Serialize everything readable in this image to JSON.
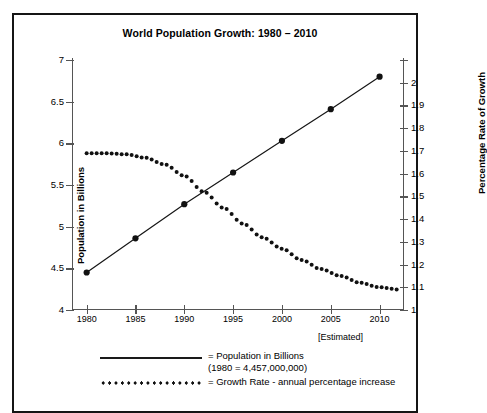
{
  "chart_data": {
    "type": "line",
    "title": "World Population Growth: 1980 – 2010",
    "xlabel": "",
    "x_note": "[Estimated]",
    "categories": [
      1980,
      1985,
      1990,
      1995,
      2000,
      2005,
      2010
    ],
    "xlim": [
      1978.5,
      2012.5
    ],
    "xticks": [
      "1980",
      "1985",
      "1990",
      "1995",
      "2000",
      "2005",
      "2010"
    ],
    "grid": false,
    "legend_position": "below-plot",
    "axes": {
      "left": {
        "label": "Population in Billions",
        "min": 4,
        "max": 7,
        "step": 0.5,
        "ticks": [
          "4",
          "4.5",
          "5",
          "5.5",
          "6",
          "6.5",
          "7"
        ]
      },
      "right": {
        "label": "Percentage Rate of Growth",
        "min": 1,
        "max": 2.1,
        "step": 0.1,
        "ticks": [
          "1",
          "1.1",
          "1.2",
          "1.3",
          "1.4",
          "1.5",
          "1.6",
          "1.7",
          "1.8",
          "1.9",
          "2",
          ""
        ]
      }
    },
    "series": [
      {
        "name": "Population in Billions",
        "axis": "left",
        "style": "solid-line-with-markers",
        "values": [
          4.45,
          4.86,
          5.27,
          5.65,
          6.03,
          6.41,
          6.8
        ]
      },
      {
        "name": "Growth Rate - annual percentage increase",
        "axis": "right",
        "style": "dotted-line",
        "x": [
          1980,
          1982,
          1984,
          1986,
          1988,
          1990,
          1992,
          1994,
          1996,
          1998,
          2000,
          2002,
          2004,
          2006,
          2008,
          2010,
          2012
        ],
        "values": [
          1.69,
          1.69,
          1.685,
          1.67,
          1.64,
          1.59,
          1.52,
          1.45,
          1.38,
          1.32,
          1.27,
          1.22,
          1.18,
          1.15,
          1.12,
          1.1,
          1.09
        ]
      }
    ],
    "legend": [
      {
        "marker": "solid-line",
        "text": "= Population in Billions",
        "subtext": "(1980 = 4,457,000,000)"
      },
      {
        "marker": "dotted-line",
        "text": "= Growth Rate - annual percentage increase",
        "subtext": ""
      }
    ]
  }
}
